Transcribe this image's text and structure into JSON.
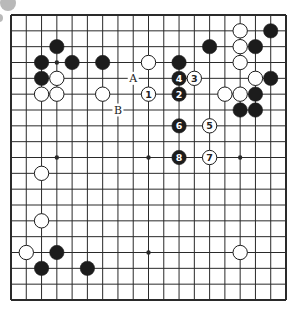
{
  "diagram": {
    "type": "go-board",
    "size": 19,
    "board": {
      "left": 11,
      "top": 15,
      "right": 286,
      "bottom": 300
    },
    "colors": {
      "line": "#2a2a2a",
      "black_stone": "#1c1c1c",
      "white_stone": "#ffffff",
      "background": "#ffffff",
      "decor_circle": "#b9b9b9"
    },
    "star_points": [
      [
        3,
        3
      ],
      [
        9,
        3
      ],
      [
        15,
        3
      ],
      [
        3,
        9
      ],
      [
        9,
        9
      ],
      [
        15,
        9
      ],
      [
        3,
        15
      ],
      [
        9,
        15
      ],
      [
        15,
        15
      ]
    ],
    "stones": [
      {
        "c": 3,
        "r": 2,
        "color": "black"
      },
      {
        "c": 2,
        "r": 3,
        "color": "black"
      },
      {
        "c": 4,
        "r": 3,
        "color": "black"
      },
      {
        "c": 6,
        "r": 3,
        "color": "black"
      },
      {
        "c": 2,
        "r": 4,
        "color": "black"
      },
      {
        "c": 3,
        "r": 4,
        "color": "white"
      },
      {
        "c": 2,
        "r": 5,
        "color": "white"
      },
      {
        "c": 3,
        "r": 5,
        "color": "white"
      },
      {
        "c": 6,
        "r": 5,
        "color": "white"
      },
      {
        "c": 9,
        "r": 3,
        "color": "white"
      },
      {
        "c": 11,
        "r": 3,
        "color": "black"
      },
      {
        "c": 13,
        "r": 2,
        "color": "black"
      },
      {
        "c": 15,
        "r": 1,
        "color": "white"
      },
      {
        "c": 17,
        "r": 1,
        "color": "black"
      },
      {
        "c": 15,
        "r": 2,
        "color": "white"
      },
      {
        "c": 16,
        "r": 2,
        "color": "black"
      },
      {
        "c": 15,
        "r": 3,
        "color": "white"
      },
      {
        "c": 16,
        "r": 4,
        "color": "white"
      },
      {
        "c": 17,
        "r": 4,
        "color": "black"
      },
      {
        "c": 14,
        "r": 5,
        "color": "white"
      },
      {
        "c": 15,
        "r": 5,
        "color": "white"
      },
      {
        "c": 16,
        "r": 5,
        "color": "black"
      },
      {
        "c": 15,
        "r": 6,
        "color": "black"
      },
      {
        "c": 16,
        "r": 6,
        "color": "black"
      },
      {
        "c": 2,
        "r": 10,
        "color": "white"
      },
      {
        "c": 2,
        "r": 13,
        "color": "white"
      },
      {
        "c": 1,
        "r": 15,
        "color": "white"
      },
      {
        "c": 3,
        "r": 15,
        "color": "black"
      },
      {
        "c": 2,
        "r": 16,
        "color": "black"
      },
      {
        "c": 5,
        "r": 16,
        "color": "black"
      },
      {
        "c": 15,
        "r": 15,
        "color": "white"
      }
    ],
    "numbered_moves": [
      {
        "n": "1",
        "c": 9,
        "r": 5,
        "color": "white"
      },
      {
        "n": "2",
        "c": 11,
        "r": 5,
        "color": "black"
      },
      {
        "n": "3",
        "c": 12,
        "r": 4,
        "color": "white"
      },
      {
        "n": "4",
        "c": 11,
        "r": 4,
        "color": "black"
      },
      {
        "n": "5",
        "c": 13,
        "r": 7,
        "color": "white"
      },
      {
        "n": "6",
        "c": 11,
        "r": 7,
        "color": "black"
      },
      {
        "n": "7",
        "c": 13,
        "r": 9,
        "color": "white"
      },
      {
        "n": "8",
        "c": 11,
        "r": 9,
        "color": "black"
      }
    ],
    "letter_marks": [
      {
        "label": "A",
        "c": 8,
        "r": 4
      },
      {
        "label": "B",
        "c": 7,
        "r": 6
      }
    ],
    "decorations": [
      {
        "cx": 8,
        "cy": 3,
        "r": 8
      },
      {
        "cx": -1,
        "cy": 18,
        "r": 4
      }
    ]
  }
}
